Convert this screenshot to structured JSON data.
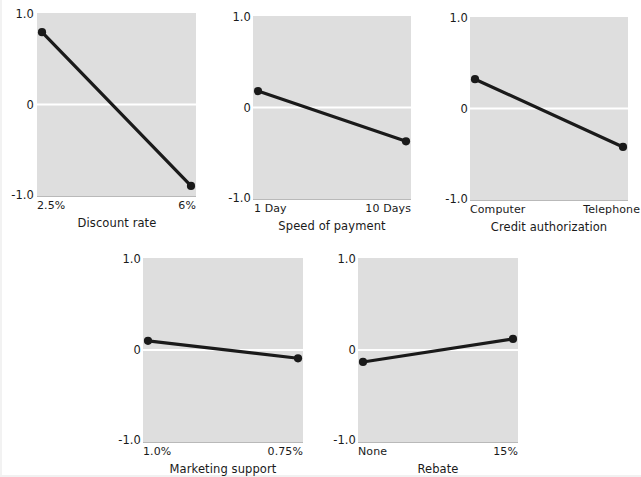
{
  "figure": {
    "background_color": "#ffffff",
    "panel_fill_color": "#dedede",
    "line_color": "#1a1a1a",
    "zero_line_color": "#ffffff",
    "ytick_labels": [
      "1.0",
      "0",
      "-1.0"
    ]
  },
  "chart_data": [
    {
      "type": "line",
      "title": "",
      "xlabel": "Discount rate",
      "ylabel": "",
      "ylim": [
        -1.0,
        1.0
      ],
      "yticks": [
        1.0,
        0,
        -1.0
      ],
      "ytick_labels": [
        "1.0",
        "0",
        "-1.0"
      ],
      "categories": [
        "2.5%",
        "6%"
      ],
      "values": [
        0.79,
        -0.89
      ],
      "grid": "zero-line-only",
      "legend": "none",
      "markers": true
    },
    {
      "type": "line",
      "title": "",
      "xlabel": "Speed of payment",
      "ylabel": "",
      "ylim": [
        -1.0,
        1.0
      ],
      "yticks": [
        1.0,
        0,
        -1.0
      ],
      "ytick_labels": [
        "1.0",
        "0",
        "-1.0"
      ],
      "categories": [
        "1 Day",
        "10 Days"
      ],
      "values": [
        0.18,
        -0.37
      ],
      "grid": "zero-line-only",
      "legend": "none",
      "markers": true
    },
    {
      "type": "line",
      "title": "",
      "xlabel": "Credit authorization",
      "ylabel": "",
      "ylim": [
        -1.0,
        1.0
      ],
      "yticks": [
        1.0,
        0,
        -1.0
      ],
      "ytick_labels": [
        "1.0",
        "0",
        "-1.0"
      ],
      "categories": [
        "Computer",
        "Telephone"
      ],
      "values": [
        0.32,
        -0.42
      ],
      "grid": "zero-line-only",
      "legend": "none",
      "markers": true
    },
    {
      "type": "line",
      "title": "",
      "xlabel": "Marketing support",
      "ylabel": "",
      "ylim": [
        -1.0,
        1.0
      ],
      "yticks": [
        1.0,
        0,
        -1.0
      ],
      "ytick_labels": [
        "1.0",
        "0",
        "-1.0"
      ],
      "categories": [
        "1.0%",
        "0.75%"
      ],
      "values": [
        0.1,
        -0.09
      ],
      "grid": "zero-line-only",
      "legend": "none",
      "markers": true
    },
    {
      "type": "line",
      "title": "",
      "xlabel": "Rebate",
      "ylabel": "",
      "ylim": [
        -1.0,
        1.0
      ],
      "yticks": [
        1.0,
        0,
        -1.0
      ],
      "ytick_labels": [
        "1.0",
        "0",
        "-1.0"
      ],
      "categories": [
        "None",
        "15%"
      ],
      "values": [
        -0.13,
        0.12
      ],
      "grid": "zero-line-only",
      "legend": "none",
      "markers": true
    }
  ],
  "panels": [
    {
      "id": "discount-rate",
      "xlabel": "Discount rate",
      "ytick_top": "1.0",
      "ytick_mid": "0",
      "ytick_bottom": "-1.0",
      "xtick_left": "2.5%",
      "xtick_right": "6%",
      "value_left": 0.79,
      "value_right": -0.89
    },
    {
      "id": "speed-of-payment",
      "xlabel": "Speed of payment",
      "ytick_top": "1.0",
      "ytick_mid": "0",
      "ytick_bottom": "-1.0",
      "xtick_left": "1 Day",
      "xtick_right": "10 Days",
      "value_left": 0.18,
      "value_right": -0.37
    },
    {
      "id": "credit-authorization",
      "xlabel": "Credit authorization",
      "ytick_top": "1.0",
      "ytick_mid": "0",
      "ytick_bottom": "-1.0",
      "xtick_left": "Computer",
      "xtick_right": "Telephone",
      "value_left": 0.32,
      "value_right": -0.42
    },
    {
      "id": "marketing-support",
      "xlabel": "Marketing support",
      "ytick_top": "1.0",
      "ytick_mid": "0",
      "ytick_bottom": "-1.0",
      "xtick_left": "1.0%",
      "xtick_right": "0.75%",
      "value_left": 0.1,
      "value_right": -0.09
    },
    {
      "id": "rebate",
      "xlabel": "Rebate",
      "ytick_top": "1.0",
      "ytick_mid": "0",
      "ytick_bottom": "-1.0",
      "xtick_left": "None",
      "xtick_right": "15%",
      "value_left": -0.13,
      "value_right": 0.12
    }
  ]
}
